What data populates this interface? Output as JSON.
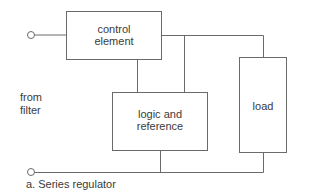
{
  "diagram": {
    "blocks": {
      "control": {
        "line1": "control",
        "line2": "element"
      },
      "logic": {
        "line1": "logic and",
        "line2": "reference"
      },
      "load": {
        "label": "load"
      }
    },
    "input_label": {
      "line1": "from",
      "line2": "filter"
    },
    "caption": "a. Series regulator",
    "colors": {
      "line": "#666666",
      "text": "#3a3a3a"
    }
  }
}
